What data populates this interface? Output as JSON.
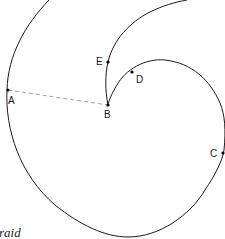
{
  "diagram": {
    "type": "spiral-curve",
    "points": [
      {
        "id": "A",
        "label": "A",
        "x": 8,
        "y": 90
      },
      {
        "id": "B",
        "label": "B",
        "x": 108,
        "y": 105
      },
      {
        "id": "C",
        "label": "C",
        "x": 224,
        "y": 153
      },
      {
        "id": "D",
        "label": "D",
        "x": 132,
        "y": 72
      },
      {
        "id": "E",
        "label": "E",
        "x": 108,
        "y": 62
      }
    ],
    "dashed_segment": {
      "from": "A",
      "to": "B"
    },
    "stroke_color": "#1a1a1a",
    "dash_color": "#888888"
  },
  "caption": {
    "text": "raid"
  }
}
